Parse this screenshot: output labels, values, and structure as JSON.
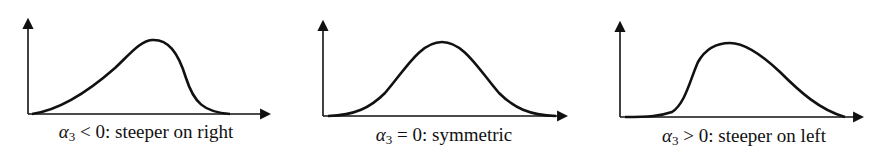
{
  "panels": [
    {
      "symbol": "α",
      "subscript": "3",
      "caption_rest": " < 0: steeper on right",
      "skew": "negative"
    },
    {
      "symbol": "α",
      "subscript": "3",
      "caption_rest": " = 0: symmetric",
      "skew": "zero"
    },
    {
      "symbol": "α",
      "subscript": "3",
      "caption_rest": " > 0: steeper on left",
      "skew": "positive"
    }
  ],
  "colors": {
    "stroke": "#111111",
    "background": "#ffffff"
  }
}
